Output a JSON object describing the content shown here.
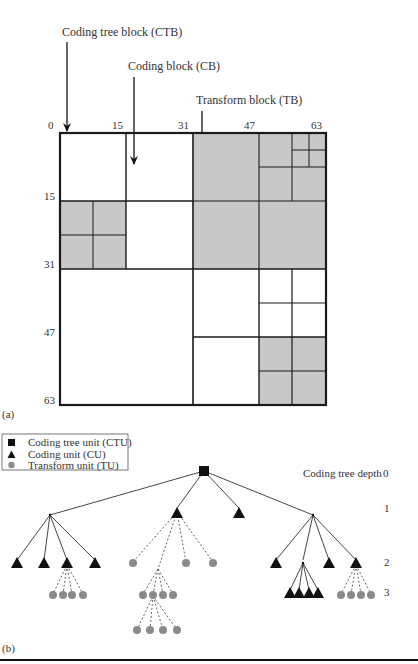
{
  "panel_a": {
    "label": "(a)",
    "annotations": {
      "ctb": "Coding tree block (CTB)",
      "cb": "Coding block (CB)",
      "tb": "Transform block (TB)"
    },
    "x_ticks": [
      "0",
      "15",
      "31",
      "47",
      "63"
    ],
    "y_ticks": [
      "15",
      "31",
      "47",
      "63"
    ],
    "colors": {
      "shaded": "#c8c8c8",
      "line": "#1a1a1a"
    }
  },
  "panel_b": {
    "label": "(b)",
    "legend": [
      {
        "symbol": "square-icon",
        "label": "Coding tree unit (CTU)"
      },
      {
        "symbol": "triangle-icon",
        "label": "Coding unit (CU)"
      },
      {
        "symbol": "circle-icon",
        "label": "Transform unit (TU)"
      }
    ],
    "depth_title": "Coding tree depth",
    "depths": [
      "0",
      "1",
      "2",
      "3"
    ],
    "colors": {
      "ctu": "#111111",
      "cu": "#111111",
      "tu": "#8a8a8a"
    }
  }
}
